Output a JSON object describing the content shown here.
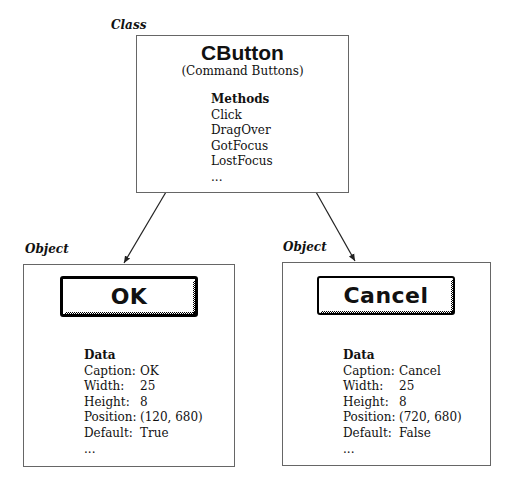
{
  "class_label": "Class",
  "class_box": {
    "title": "CButton",
    "subtitle": "(Command Buttons)",
    "methods_heading": "Methods",
    "methods": [
      "Click",
      "DragOver",
      "GotFocus",
      "LostFocus",
      "..."
    ]
  },
  "objects": [
    {
      "label": "Object",
      "button_caption": "OK",
      "is_default": true,
      "data_heading": "Data",
      "fields": [
        {
          "key": "Caption:",
          "value": "OK"
        },
        {
          "key": "Width:",
          "value": "25"
        },
        {
          "key": "Height:",
          "value": "8"
        },
        {
          "key": "Position:",
          "value": "(120, 680)"
        },
        {
          "key": "Default:",
          "value": "True"
        }
      ],
      "ellipsis": "..."
    },
    {
      "label": "Object",
      "button_caption": "Cancel",
      "is_default": false,
      "data_heading": "Data",
      "fields": [
        {
          "key": "Caption:",
          "value": "Cancel"
        },
        {
          "key": "Width:",
          "value": "25"
        },
        {
          "key": "Height:",
          "value": "8"
        },
        {
          "key": "Position:",
          "value": "(720, 680)"
        },
        {
          "key": "Default:",
          "value": "False"
        }
      ],
      "ellipsis": "..."
    }
  ],
  "colors": {
    "box_border": "#666666",
    "text": "#111111",
    "background": "#ffffff"
  }
}
